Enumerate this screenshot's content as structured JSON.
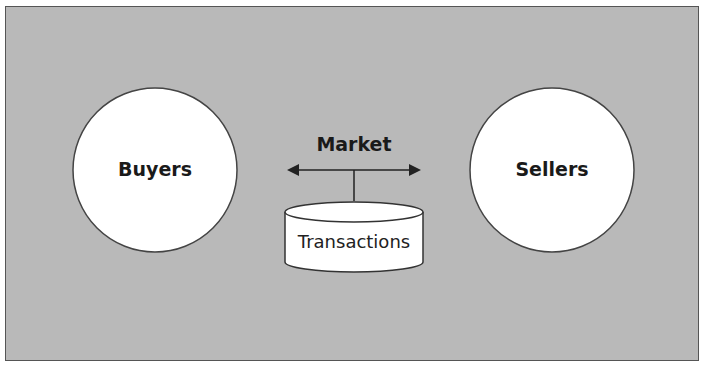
{
  "diagram": {
    "nodes": {
      "buyers": {
        "label": "Buyers"
      },
      "sellers": {
        "label": "Sellers"
      },
      "market": {
        "label": "Market"
      },
      "transactions": {
        "label": "Transactions"
      }
    },
    "edges": [
      {
        "from": "market",
        "to": "buyers",
        "type": "arrow"
      },
      {
        "from": "market",
        "to": "sellers",
        "type": "arrow"
      },
      {
        "from": "market",
        "to": "transactions",
        "type": "line"
      }
    ],
    "colors": {
      "background": "#b9b9b9",
      "node_fill": "#ffffff",
      "stroke": "#333333"
    }
  }
}
